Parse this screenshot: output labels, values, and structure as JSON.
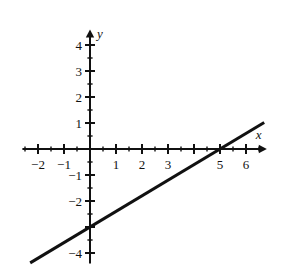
{
  "chart_data": {
    "type": "line",
    "title": "",
    "subtitle": "",
    "xlabel": "x",
    "ylabel": "y",
    "xlim": [
      -2.6,
      6.8
    ],
    "ylim": [
      -4.4,
      4.6
    ],
    "grid": false,
    "legend": null,
    "background_color": "#ffffff",
    "line_color": "#111111",
    "axis_color": "#111111",
    "line_width_px": 3,
    "axis_width_px": 2,
    "equation": "y = 0.6x - 3",
    "slope": 0.6,
    "y_intercept": -3,
    "x_intercept": 5,
    "series": [
      {
        "name": "line",
        "points": [
          {
            "x": -2.3,
            "y": -4.38
          },
          {
            "x": 0,
            "y": -3
          },
          {
            "x": 5,
            "y": 0
          },
          {
            "x": 6.7,
            "y": 1.02
          }
        ]
      }
    ],
    "x_major_ticks": [
      -2,
      -1,
      0,
      1,
      2,
      3,
      4,
      5,
      6
    ],
    "x_minor_ticks": [
      -2.5,
      -1.5,
      -0.5,
      0.5,
      1.5,
      2.5,
      3.5,
      4.5,
      5.5,
      6.5
    ],
    "y_major_ticks": [
      -4,
      -3,
      -2,
      -1,
      0,
      1,
      2,
      3,
      4
    ],
    "y_minor_ticks": [
      -3.5,
      -2.5,
      -1.5,
      -0.5,
      0.5,
      1.5,
      2.5,
      3.5
    ],
    "x_tick_labels": [
      {
        "value": -2,
        "text": "−2"
      },
      {
        "value": -1,
        "text": "−1"
      },
      {
        "value": 1,
        "text": "1"
      },
      {
        "value": 2,
        "text": "2"
      },
      {
        "value": 3,
        "text": "3"
      },
      {
        "value": 5,
        "text": "5"
      },
      {
        "value": 6,
        "text": "6"
      }
    ],
    "y_tick_labels": [
      {
        "value": 4,
        "text": "4"
      },
      {
        "value": 3,
        "text": "3"
      },
      {
        "value": 2,
        "text": "2"
      },
      {
        "value": 1,
        "text": "1"
      },
      {
        "value": -1,
        "text": "−1"
      },
      {
        "value": -2,
        "text": "−2"
      },
      {
        "value": -4,
        "text": "−4"
      }
    ]
  },
  "labels": {
    "x_axis_name": "x",
    "y_axis_name": "y",
    "xt_n2": "−2",
    "xt_n1": "−1",
    "xt_1": "1",
    "xt_2": "2",
    "xt_3": "3",
    "xt_5": "5",
    "xt_6": "6",
    "yt_4": "4",
    "yt_3": "3",
    "yt_2": "2",
    "yt_1": "1",
    "yt_n1": "−1",
    "yt_n2": "−2",
    "yt_n4": "−4"
  }
}
